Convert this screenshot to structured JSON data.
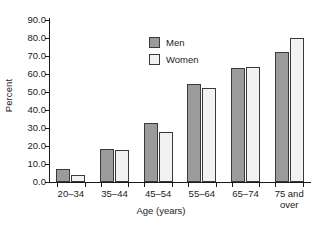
{
  "chart_data": {
    "type": "bar",
    "title": "",
    "subtitle": "",
    "xlabel": "Age (years)",
    "ylabel": "Percent",
    "categories": [
      "20–34",
      "35–44",
      "45–54",
      "55–64",
      "65–74",
      "75 and over"
    ],
    "category_lines": [
      [
        "20–34"
      ],
      [
        "35–44"
      ],
      [
        "45–54"
      ],
      [
        "55–64"
      ],
      [
        "65–74"
      ],
      [
        "75 and",
        "over"
      ]
    ],
    "series": [
      {
        "name": "Men",
        "color": "#9b9b9b",
        "values": [
          7.0,
          18.5,
          33.0,
          54.5,
          63.5,
          72.0
        ]
      },
      {
        "name": "Women",
        "color": "#f2f2f2",
        "values": [
          4.0,
          18.0,
          28.0,
          52.0,
          64.0,
          80.0
        ]
      }
    ],
    "ylim": [
      0.0,
      90.0
    ],
    "ytick_values": [
      0.0,
      10.0,
      20.0,
      30.0,
      40.0,
      50.0,
      60.0,
      70.0,
      80.0,
      90.0
    ],
    "ytick_labels": [
      "0.0",
      "10.0",
      "20.0",
      "30.0",
      "40.0",
      "50.0",
      "60.0",
      "70.0",
      "80.0",
      "90.0"
    ],
    "grid": false,
    "legend_position": "top-left-inside",
    "bar_outline_color": "#3a3a3a",
    "axis_color": "#1a1a1a",
    "background_color": "#ffffff"
  },
  "legend": {
    "items": [
      {
        "label": "Men",
        "swatch": "men-swatch"
      },
      {
        "label": "Women",
        "swatch": "women-swatch"
      }
    ]
  }
}
